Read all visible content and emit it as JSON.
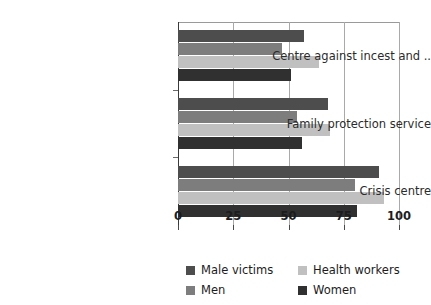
{
  "chart_data": {
    "type": "bar",
    "orientation": "horizontal",
    "title": "",
    "subtitle": "",
    "xlabel": "",
    "ylabel": "",
    "xlim": [
      0,
      100
    ],
    "xticks": [
      0,
      25,
      50,
      75,
      100
    ],
    "xtick_labels": [
      "0",
      "25",
      "50",
      "75",
      "100"
    ],
    "grid": true,
    "grid_axis": "x",
    "legend_position": "bottom",
    "legend_columns": 2,
    "categories": [
      "Centre against incest and ..",
      "Family protection service",
      "Crisis centre"
    ],
    "series": [
      {
        "name": "Male victims",
        "color": "#4d4d4d",
        "values": [
          57,
          68,
          91
        ]
      },
      {
        "name": "Men",
        "color": "#7d7d7d",
        "values": [
          47,
          54,
          80
        ]
      },
      {
        "name": "Health workers",
        "color": "#c0c0c0",
        "values": [
          64,
          69,
          93
        ]
      },
      {
        "name": "Women",
        "color": "#303030",
        "values": [
          51,
          56,
          81
        ]
      }
    ],
    "legend_order": [
      "Male victims",
      "Health workers",
      "Men",
      "Women"
    ]
  },
  "colors": {
    "background": "#ffffff",
    "axis": "#3a3a3a",
    "gridline": "#a9a9a9",
    "text": "#1c1c1c",
    "male_victims": "#4d4d4d",
    "men": "#7d7d7d",
    "health_workers": "#c0c0c0",
    "women": "#303030"
  }
}
